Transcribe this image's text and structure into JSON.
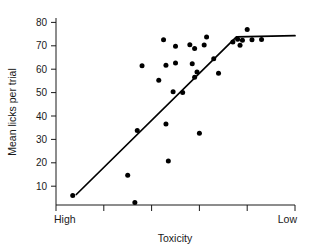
{
  "chart_data": {
    "type": "scatter",
    "title": "",
    "xlabel": "Toxicity",
    "ylabel": "Mean licks per trial",
    "x_axis": {
      "left_label": "High",
      "right_label": "Low",
      "tick_count": 6,
      "tick_labels": [
        "",
        "",
        "",
        "",
        "",
        ""
      ],
      "direction": "decreasing-toxicity",
      "range_px": [
        56,
        295
      ]
    },
    "y_axis": {
      "ticks": [
        10,
        20,
        30,
        40,
        50,
        60,
        70,
        80
      ],
      "tick_labels": [
        "10",
        "20",
        "30",
        "40",
        "50",
        "60",
        "70",
        "80"
      ],
      "ylim": [
        0,
        82
      ],
      "grid": false
    },
    "legend": null,
    "points": [
      {
        "x": 0.07,
        "y": 6
      },
      {
        "x": 0.3,
        "y": 14.7
      },
      {
        "x": 0.33,
        "y": 3
      },
      {
        "x": 0.34,
        "y": 33.8
      },
      {
        "x": 0.36,
        "y": 61.5
      },
      {
        "x": 0.43,
        "y": 55.3
      },
      {
        "x": 0.45,
        "y": 72.6
      },
      {
        "x": 0.46,
        "y": 61.7
      },
      {
        "x": 0.46,
        "y": 36.6
      },
      {
        "x": 0.47,
        "y": 20.8
      },
      {
        "x": 0.49,
        "y": 50.4
      },
      {
        "x": 0.5,
        "y": 62.6
      },
      {
        "x": 0.5,
        "y": 69.8
      },
      {
        "x": 0.53,
        "y": 50
      },
      {
        "x": 0.56,
        "y": 70.5
      },
      {
        "x": 0.57,
        "y": 62.3
      },
      {
        "x": 0.58,
        "y": 68.8
      },
      {
        "x": 0.58,
        "y": 56.6
      },
      {
        "x": 0.59,
        "y": 58.8
      },
      {
        "x": 0.6,
        "y": 32.6
      },
      {
        "x": 0.62,
        "y": 70.3
      },
      {
        "x": 0.63,
        "y": 73.8
      },
      {
        "x": 0.66,
        "y": 64.5
      },
      {
        "x": 0.68,
        "y": 58.3
      },
      {
        "x": 0.74,
        "y": 71.6
      },
      {
        "x": 0.76,
        "y": 72.8
      },
      {
        "x": 0.77,
        "y": 70.2
      },
      {
        "x": 0.78,
        "y": 72.4
      },
      {
        "x": 0.8,
        "y": 77
      },
      {
        "x": 0.82,
        "y": 72.6
      },
      {
        "x": 0.86,
        "y": 72.7
      }
    ],
    "fit_line": {
      "description": "two-segment piecewise linear fit: rising segment then plateau",
      "vertices": [
        {
          "x": 0.085,
          "y": 4.5
        },
        {
          "x": 0.755,
          "y": 72.3
        },
        {
          "x": 1.0,
          "y": 72.8
        }
      ]
    }
  }
}
